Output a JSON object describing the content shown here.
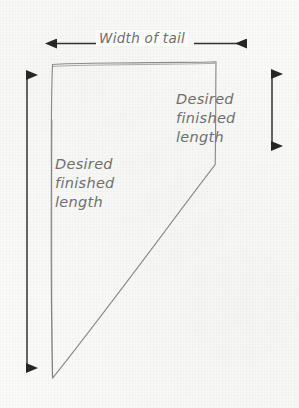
{
  "diagram": {
    "background_color": "#fbfbfa",
    "ink_color": "#4a4a4a",
    "text_color": "#6f6f6f",
    "labels": {
      "width_of_tail": "Width of tail",
      "right_length_line1": "Desired",
      "right_length_line2": "finished",
      "right_length_line3": "length",
      "left_length_line1": "Desired",
      "left_length_line2": "finished",
      "left_length_line3": "length"
    },
    "shape": {
      "name": "tail-pattern-outline",
      "description": "hand-drawn quadrilateral with flat top, straight left side, short right side and long diagonal from right side to bottom point",
      "vertices": [
        {
          "x": 52,
          "y": 64
        },
        {
          "x": 216,
          "y": 62
        },
        {
          "x": 215,
          "y": 165
        },
        {
          "x": 52,
          "y": 378
        }
      ]
    },
    "arrows": {
      "width_arrow": {
        "orientation": "horizontal",
        "heads": "both",
        "from": {
          "x": 44,
          "y": 43
        },
        "to": {
          "x": 258,
          "y": 43
        }
      },
      "left_length_arrow": {
        "orientation": "vertical",
        "heads": "both",
        "from": {
          "x": 27,
          "y": 63
        },
        "to": {
          "x": 27,
          "y": 380
        }
      },
      "right_length_arrow": {
        "orientation": "vertical",
        "heads": "both",
        "from": {
          "x": 272,
          "y": 62
        },
        "to": {
          "x": 272,
          "y": 158
        }
      }
    }
  }
}
